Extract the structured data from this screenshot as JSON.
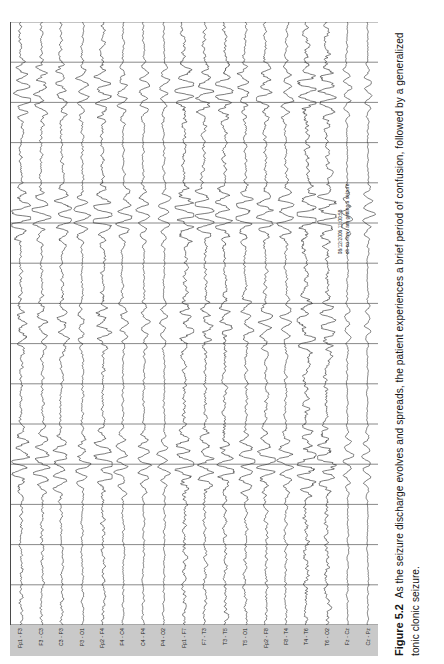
{
  "figure": {
    "number_label": "Figure 5.2",
    "caption_text": "As the seizure discharge evolves and spreads, the patient experiences a brief period of confusion, followed by a generalized tonic clonic seizure."
  },
  "annotation": {
    "timestamp": "08/12/2006 11:00:58",
    "note": "oh no now i am getting a seizure"
  },
  "colors": {
    "trace": "#2b2b2b",
    "grid": "#555555",
    "label_band": "#c9c9c9",
    "background": "#ffffff",
    "caption_text": "#131313"
  },
  "chart_data": {
    "type": "line",
    "title": "",
    "subtitle": "",
    "xlabel": "",
    "ylabel": "",
    "grid": true,
    "legend_position": "left",
    "axis_note": "EEG multichannel recording, bipolar double-banana montage; vertical gridlines mark 1-second epochs",
    "x": [
      0,
      1,
      2,
      3,
      4,
      5,
      6,
      7,
      8,
      9,
      10,
      11,
      12,
      13,
      14,
      15
    ],
    "xlim": [
      0,
      15
    ],
    "gridline_count": 15,
    "channel_count": 18,
    "categories": [
      "Fp1 - F3",
      "F3 - C3",
      "C3 - P3",
      "P3 - O1",
      "Fp2 - F4",
      "F4 - C4",
      "C4 - P4",
      "P4 - O2",
      "Fp1 - F7",
      "F7 - T3",
      "T3 - T5",
      "T5 - O1",
      "Fp2 - F8",
      "F8 - T4",
      "T4 - T6",
      "T6 - O2",
      "Fz - Cz",
      "Cz - Pz"
    ],
    "series": [
      {
        "name": "Fp1 - F3",
        "amplitude": 1.0,
        "noise": 0.85,
        "seed": 11
      },
      {
        "name": "F3 - C3",
        "amplitude": 0.92,
        "noise": 0.8,
        "seed": 23
      },
      {
        "name": "C3 - P3",
        "amplitude": 0.88,
        "noise": 0.82,
        "seed": 37
      },
      {
        "name": "P3 - O1",
        "amplitude": 0.8,
        "noise": 0.7,
        "seed": 41
      },
      {
        "name": "Fp2 - F4",
        "amplitude": 1.05,
        "noise": 0.88,
        "seed": 53
      },
      {
        "name": "F4 - C4",
        "amplitude": 0.78,
        "noise": 0.66,
        "seed": 67
      },
      {
        "name": "C4 - P4",
        "amplitude": 0.74,
        "noise": 0.64,
        "seed": 79
      },
      {
        "name": "P4 - O2",
        "amplitude": 0.7,
        "noise": 0.6,
        "seed": 83
      },
      {
        "name": "Fp1 - F7",
        "amplitude": 1.1,
        "noise": 0.92,
        "seed": 97
      },
      {
        "name": "F7 - T3",
        "amplitude": 0.96,
        "noise": 0.86,
        "seed": 101
      },
      {
        "name": "T3 - T5",
        "amplitude": 1.02,
        "noise": 0.95,
        "seed": 113
      },
      {
        "name": "T5 - O1",
        "amplitude": 0.9,
        "noise": 0.84,
        "seed": 127
      },
      {
        "name": "Fp2 - F8",
        "amplitude": 0.98,
        "noise": 0.8,
        "seed": 139
      },
      {
        "name": "F8 - T4",
        "amplitude": 0.86,
        "noise": 0.72,
        "seed": 149
      },
      {
        "name": "T4 - T6",
        "amplitude": 1.18,
        "noise": 1.05,
        "seed": 163
      },
      {
        "name": "T6 - O2",
        "amplitude": 1.12,
        "noise": 1.0,
        "seed": 173
      },
      {
        "name": "Fz - Cz",
        "amplitude": 0.62,
        "noise": 0.52,
        "seed": 181
      },
      {
        "name": "Cz - Pz",
        "amplitude": 0.58,
        "noise": 0.48,
        "seed": 191
      }
    ],
    "burst_windows": [
      {
        "start": 0.2,
        "end": 0.34,
        "gain": 2.4
      },
      {
        "start": 0.44,
        "end": 0.56,
        "gain": 2.0
      },
      {
        "start": 0.62,
        "end": 0.74,
        "gain": 2.6
      },
      {
        "start": 0.82,
        "end": 0.95,
        "gain": 2.2
      }
    ]
  }
}
